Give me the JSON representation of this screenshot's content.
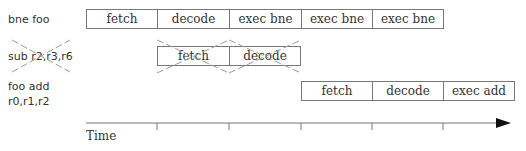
{
  "rows": [
    {
      "label_lines": [
        "bne foo"
      ],
      "stages": [
        "fetch",
        "decode",
        "exec bne",
        "exec bne",
        "exec bne"
      ],
      "start_slot": 0,
      "cancelled": false
    },
    {
      "label_lines": [
        "sub r2,r3,r6"
      ],
      "stages": [
        "fetch",
        "decode"
      ],
      "start_slot": 1,
      "cancelled": true
    },
    {
      "label_lines": [
        "foo add",
        "r0,r1,r2"
      ],
      "stages": [
        "fetch",
        "decode",
        "exec add"
      ],
      "start_slot": 3,
      "cancelled": false
    }
  ],
  "axis": {
    "label": "Time",
    "tick_count": 5
  },
  "colors": {
    "line": "#777777",
    "text": "#333333",
    "cross": "#999999",
    "arrow": "#111111"
  }
}
